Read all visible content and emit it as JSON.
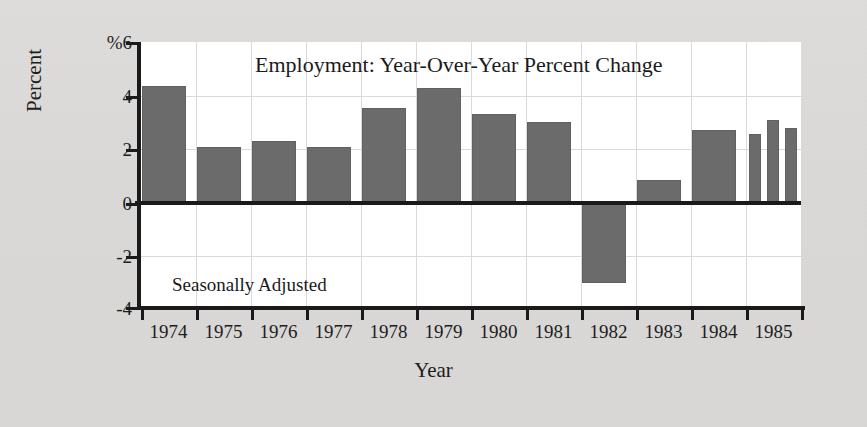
{
  "figure": {
    "background_color": "#dcdcda",
    "plot_background_color": "#ffffff",
    "bar_color": "#6b6b6b",
    "axis_color": "#1a1a1a",
    "grid_color": "#dadada"
  },
  "chart_data": {
    "type": "bar",
    "title": "Employment: Year-Over-Year Percent Change",
    "annotation": "Seasonally Adjusted",
    "xlabel": "Year",
    "ylabel": "Percent",
    "ylim": [
      -4,
      6
    ],
    "yticks": [
      6,
      4,
      2,
      0,
      -2,
      -4
    ],
    "ytick_labels": [
      "%6",
      "4",
      "2",
      "0",
      "-2",
      "-4"
    ],
    "grid": true,
    "legend": null,
    "categories": [
      "1974",
      "1975",
      "1976",
      "1977",
      "1978",
      "1979",
      "1980",
      "1981",
      "1982",
      "1983",
      "1984",
      "1985"
    ],
    "values": [
      4.35,
      2.1,
      2.3,
      2.1,
      3.55,
      4.3,
      3.3,
      3.0,
      -3.0,
      0.85,
      2.7,
      null
    ],
    "bars": [
      {
        "year": "1974",
        "value": 4.35,
        "x": 0.02,
        "width": 0.8
      },
      {
        "year": "1975",
        "value": 2.1,
        "x": 0.02,
        "width": 0.8
      },
      {
        "year": "1976",
        "value": 2.3,
        "x": 0.02,
        "width": 0.8
      },
      {
        "year": "1977",
        "value": 2.1,
        "x": 0.02,
        "width": 0.8
      },
      {
        "year": "1978",
        "value": 3.55,
        "x": 0.02,
        "width": 0.8
      },
      {
        "year": "1979",
        "value": 4.3,
        "x": 0.02,
        "width": 0.8
      },
      {
        "year": "1980",
        "value": 3.3,
        "x": 0.02,
        "width": 0.8
      },
      {
        "year": "1981",
        "value": 3.0,
        "x": 0.02,
        "width": 0.8
      },
      {
        "year": "1982",
        "value": -3.0,
        "x": 0.02,
        "width": 0.8
      },
      {
        "year": "1983",
        "value": 0.85,
        "x": 0.02,
        "width": 0.8
      },
      {
        "year": "1984",
        "value": 2.7,
        "x": 0.02,
        "width": 0.8
      },
      {
        "year": "1985 Q1",
        "value": 2.55,
        "x": 0.06,
        "width": 0.22
      },
      {
        "year": "1985 Q2",
        "value": 3.1,
        "x": 0.38,
        "width": 0.22
      },
      {
        "year": "1985 Q3",
        "value": 2.8,
        "x": 0.7,
        "width": 0.22
      }
    ]
  }
}
